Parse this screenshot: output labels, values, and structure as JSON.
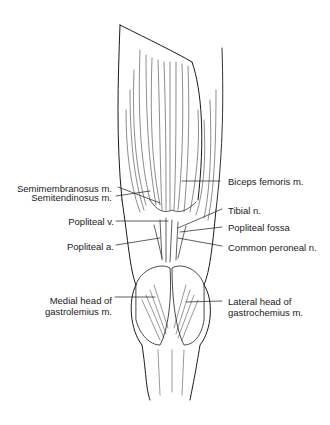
{
  "figure": {
    "labels": {
      "semimembranosus": "Semimembranosus m.",
      "semitendinosus": "Semitendinosus m.",
      "popliteal_vein": "Popliteal v.",
      "popliteal_artery": "Popliteal a.",
      "medial_head_line1": "Medial head of",
      "medial_head_line2": "gastrolemius m.",
      "biceps_femoris": "Biceps femoris m.",
      "tibial_nerve": "Tibial n.",
      "popliteal_fossa": "Popliteal fossa",
      "common_peroneal": "Common peroneal n.",
      "lateral_head_line1": "Lateral head of",
      "lateral_head_line2": "gastrochemius m."
    },
    "colors": {
      "ink": "#1a1a1a",
      "background": "#ffffff"
    }
  }
}
